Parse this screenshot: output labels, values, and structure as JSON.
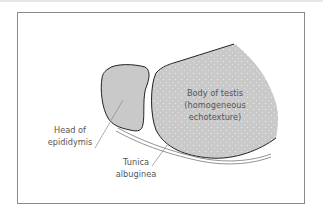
{
  "figure": {
    "labels": {
      "body_line1": "Body of testis",
      "body_line2": "(homogeneous",
      "body_line3": "echotexture)",
      "head_line1": "Head of",
      "head_line2": "epididymis",
      "tunica_line1": "Tunica",
      "tunica_line2": "albuginea"
    },
    "colors": {
      "fill": "#c9c9c9",
      "outline": "#222222",
      "label": "#555555",
      "frame": "#8a8a8a"
    }
  }
}
